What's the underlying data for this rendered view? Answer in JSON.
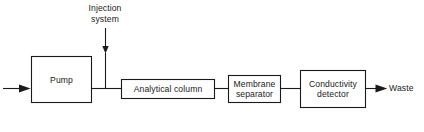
{
  "diagram": {
    "type": "block-flow-diagram",
    "stroke_color": "#1a1a1a",
    "background_color": "#ffffff",
    "nodes": [
      {
        "id": "pump",
        "label": "Pump",
        "shape": "rectangle",
        "x": 31,
        "y": 56,
        "width": 61,
        "height": 47
      },
      {
        "id": "analytical-column",
        "label": "Analytical column",
        "shape": "rectangle",
        "x": 121,
        "y": 79,
        "width": 94,
        "height": 20
      },
      {
        "id": "membrane-separator",
        "label": "Membrane\nseparator",
        "shape": "rectangle",
        "x": 228,
        "y": 75,
        "width": 53,
        "height": 28
      },
      {
        "id": "conductivity-detector",
        "label": "Conductivity\ndetector",
        "shape": "rectangle",
        "x": 300,
        "y": 70,
        "width": 66,
        "height": 38
      }
    ],
    "free_labels": [
      {
        "id": "injection-system",
        "label": "Injection\nsystem",
        "x": 82,
        "y": 3,
        "width": 46
      },
      {
        "id": "waste",
        "label": "Waste",
        "x": 389,
        "y": 83,
        "width": 33
      }
    ],
    "connectors": [
      {
        "id": "eluent-inlet",
        "from": "inlet",
        "to": "pump",
        "orientation": "horizontal",
        "arrow": true
      },
      {
        "id": "injection-inlet",
        "from": "injection-system",
        "to": "flow-line",
        "orientation": "vertical",
        "arrow": true
      },
      {
        "id": "pump-to-column",
        "from": "pump",
        "to": "analytical-column",
        "orientation": "horizontal",
        "arrow": false
      },
      {
        "id": "column-to-separator",
        "from": "analytical-column",
        "to": "membrane-separator",
        "orientation": "horizontal",
        "arrow": false
      },
      {
        "id": "separator-to-detector",
        "from": "membrane-separator",
        "to": "conductivity-detector",
        "orientation": "horizontal",
        "arrow": false
      },
      {
        "id": "detector-to-waste",
        "from": "conductivity-detector",
        "to": "waste",
        "orientation": "horizontal",
        "arrow": true
      }
    ]
  }
}
